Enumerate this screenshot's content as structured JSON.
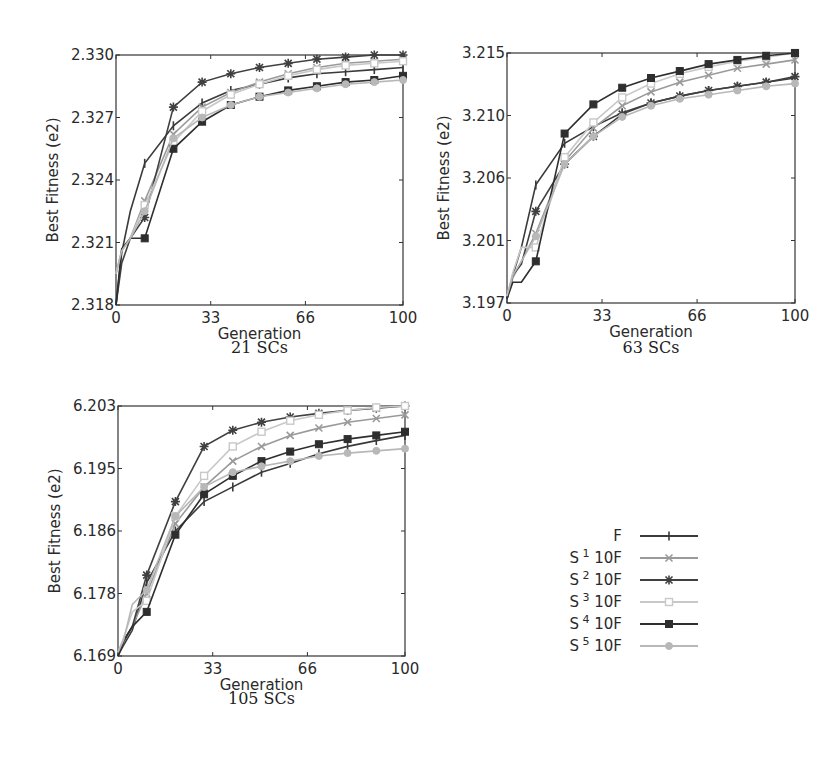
{
  "figure": {
    "legend": {
      "position": "right-middle",
      "entries": [
        {
          "label": "F",
          "sup": "",
          "suffix": "",
          "color": "#3a3a3a",
          "marker": "plus"
        },
        {
          "label": "S",
          "sup": "1",
          "suffix": "10F",
          "color": "#9a9a9a",
          "marker": "x"
        },
        {
          "label": "S",
          "sup": "2",
          "suffix": "10F",
          "color": "#404040",
          "marker": "star"
        },
        {
          "label": "S",
          "sup": "3",
          "suffix": "10F",
          "color": "#c8c8c8",
          "marker": "square-open"
        },
        {
          "label": "S",
          "sup": "4",
          "suffix": "10F",
          "color": "#2e2e2e",
          "marker": "square"
        },
        {
          "label": "S",
          "sup": "5",
          "suffix": "10F",
          "color": "#b8b8b8",
          "marker": "circle"
        }
      ]
    }
  },
  "chart_data": [
    {
      "type": "line",
      "title": "21 SCs",
      "xlabel": "Generation",
      "ylabel": "Best Fitness (e2)",
      "xlim": [
        0,
        100
      ],
      "ylim": [
        2.318,
        2.33
      ],
      "xticks": [
        "0",
        "33",
        "66",
        "100"
      ],
      "yticks": [
        "2.318",
        "2.321",
        "2.324",
        "2.327",
        "2.330"
      ],
      "grid": false,
      "x": [
        0,
        2,
        5,
        10,
        20,
        30,
        40,
        50,
        60,
        70,
        80,
        90,
        100
      ],
      "series": [
        {
          "name": "F",
          "values": [
            2.318,
            2.3205,
            2.3225,
            2.3248,
            2.3266,
            2.3277,
            2.3283,
            2.3286,
            2.3289,
            2.3291,
            2.3292,
            2.3293,
            2.3294
          ]
        },
        {
          "name": "S1 10F",
          "values": [
            2.3195,
            2.3206,
            2.3212,
            2.323,
            2.3262,
            2.3275,
            2.3282,
            2.3287,
            2.3291,
            2.3294,
            2.3296,
            2.3297,
            2.3298
          ]
        },
        {
          "name": "S2 10F",
          "values": [
            2.318,
            2.32,
            2.3212,
            2.3222,
            2.3275,
            2.3287,
            2.3291,
            2.3294,
            2.3296,
            2.3298,
            2.3299,
            2.33,
            2.33
          ]
        },
        {
          "name": "S3 10F",
          "values": [
            2.3195,
            2.3206,
            2.3212,
            2.3228,
            2.3258,
            2.3273,
            2.3281,
            2.3286,
            2.329,
            2.3293,
            2.3295,
            2.3296,
            2.3297
          ]
        },
        {
          "name": "S4 10F",
          "values": [
            2.318,
            2.3207,
            2.3212,
            2.3212,
            2.3255,
            2.3268,
            2.3276,
            2.328,
            2.3283,
            2.3285,
            2.3287,
            2.3288,
            2.329
          ]
        },
        {
          "name": "S5 10F",
          "values": [
            2.3195,
            2.3206,
            2.3212,
            2.3225,
            2.326,
            2.327,
            2.3276,
            2.328,
            2.3282,
            2.3284,
            2.3286,
            2.3287,
            2.3288
          ]
        }
      ]
    },
    {
      "type": "line",
      "title": "63 SCs",
      "xlabel": "Generation",
      "ylabel": "Best Fitness (e2)",
      "xlim": [
        0,
        100
      ],
      "ylim": [
        3.197,
        3.215
      ],
      "xticks": [
        "0",
        "33",
        "66",
        "100"
      ],
      "yticks": [
        "3.197",
        "3.201",
        "3.206",
        "3.210",
        "3.215"
      ],
      "grid": false,
      "x": [
        0,
        2,
        5,
        10,
        20,
        30,
        40,
        50,
        60,
        70,
        80,
        90,
        100
      ],
      "series": [
        {
          "name": "F",
          "values": [
            3.1973,
            3.199,
            3.201,
            3.2055,
            3.2085,
            3.2097,
            3.2107,
            3.2114,
            3.2119,
            3.2123,
            3.2126,
            3.2129,
            3.2132
          ]
        },
        {
          "name": "S1 10F",
          "values": [
            3.1975,
            3.1988,
            3.2,
            3.202,
            3.2072,
            3.2096,
            3.2112,
            3.2122,
            3.2129,
            3.2134,
            3.2139,
            3.2142,
            3.2145
          ]
        },
        {
          "name": "S2 10F",
          "values": [
            3.1973,
            3.199,
            3.1998,
            3.2036,
            3.207,
            3.209,
            3.2106,
            3.2114,
            3.2119,
            3.2123,
            3.2126,
            3.2129,
            3.2133
          ]
        },
        {
          "name": "S3 10F",
          "values": [
            3.1975,
            3.1992,
            3.201,
            3.201,
            3.2075,
            3.21,
            3.2118,
            3.2128,
            3.2135,
            3.214,
            3.2144,
            3.2147,
            3.215
          ]
        },
        {
          "name": "S4 10F",
          "values": [
            3.1973,
            3.1985,
            3.1985,
            3.2,
            3.2092,
            3.2113,
            3.2125,
            3.2132,
            3.2137,
            3.2142,
            3.2145,
            3.2148,
            3.215
          ]
        },
        {
          "name": "S5 10F",
          "values": [
            3.1975,
            3.199,
            3.2,
            3.2018,
            3.207,
            3.209,
            3.2104,
            3.2112,
            3.2117,
            3.212,
            3.2123,
            3.2126,
            3.2128
          ]
        }
      ]
    },
    {
      "type": "line",
      "title": "105 SCs",
      "xlabel": "Generation",
      "ylabel": "Best Fitness (e2)",
      "xlim": [
        0,
        100
      ],
      "ylim": [
        6.169,
        6.203
      ],
      "xticks": [
        "0",
        "33",
        "66",
        "100"
      ],
      "yticks": [
        "6.169",
        "6.178",
        "6.186",
        "6.195",
        "6.203"
      ],
      "grid": false,
      "x": [
        0,
        2,
        5,
        10,
        20,
        30,
        40,
        50,
        60,
        70,
        80,
        90,
        100
      ],
      "series": [
        {
          "name": "F",
          "values": [
            6.169,
            6.1705,
            6.1725,
            6.179,
            6.186,
            6.19,
            6.192,
            6.194,
            6.1952,
            6.1965,
            6.1975,
            6.1983,
            6.199
          ]
        },
        {
          "name": "S1 10F",
          "values": [
            6.1695,
            6.171,
            6.173,
            6.1775,
            6.187,
            6.192,
            6.1955,
            6.1975,
            6.199,
            6.2,
            6.2008,
            6.2013,
            6.2018
          ]
        },
        {
          "name": "S2 10F",
          "values": [
            6.169,
            6.1712,
            6.173,
            6.18,
            6.19,
            6.1975,
            6.1997,
            6.2008,
            6.2015,
            6.202,
            6.2024,
            6.2027,
            6.203
          ]
        },
        {
          "name": "S3 10F",
          "values": [
            6.1695,
            6.1715,
            6.175,
            6.1765,
            6.188,
            6.1935,
            6.1975,
            6.1995,
            6.201,
            6.2018,
            6.2024,
            6.2028,
            6.203
          ]
        },
        {
          "name": "S4 10F",
          "values": [
            6.169,
            6.171,
            6.173,
            6.175,
            6.1855,
            6.191,
            6.1935,
            6.1955,
            6.1968,
            6.1978,
            6.1985,
            6.199,
            6.1995
          ]
        },
        {
          "name": "S5 10F",
          "values": [
            6.1695,
            6.1712,
            6.176,
            6.178,
            6.188,
            6.192,
            6.194,
            6.1948,
            6.1955,
            6.1962,
            6.1966,
            6.1969,
            6.1972
          ]
        }
      ]
    }
  ]
}
